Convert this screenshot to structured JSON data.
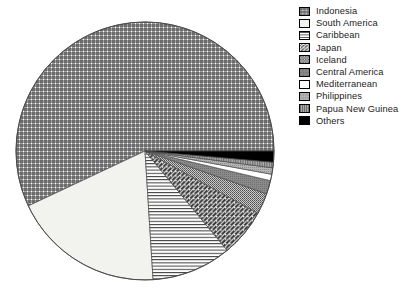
{
  "chart_data": {
    "type": "pie",
    "title": "",
    "subtitle": "",
    "xlabel": "",
    "ylabel": "",
    "legend_position": "right",
    "grid": false,
    "start_angle_deg": 0,
    "direction": "counterclockwise",
    "center": {
      "x": 145,
      "y": 151
    },
    "radius": 129,
    "categories": [
      "Indonesia",
      "South America",
      "Caribbean",
      "Japan",
      "Iceland",
      "Central America",
      "Mediterranean",
      "Philippines",
      "Papua New Guinea",
      "Others"
    ],
    "values": [
      57.0,
      19.0,
      10.0,
      6.0,
      2.6,
      1.7,
      0.8,
      0.8,
      0.7,
      1.4
    ],
    "slices": [
      {
        "label": "Indonesia",
        "value": 57.0,
        "pattern": "cross-hatch-grid",
        "fill": "#ffffff",
        "ink": "#2b2b2b",
        "start_deg": 0.0,
        "end_deg": 205.2
      },
      {
        "label": "South America",
        "value": 19.0,
        "pattern": "blank-light",
        "fill": "#f2f2ef",
        "ink": "#f2f2ef",
        "start_deg": 205.2,
        "end_deg": 273.6
      },
      {
        "label": "Caribbean",
        "value": 10.0,
        "pattern": "horizontal-lines",
        "fill": "#ffffff",
        "ink": "#3a3a3a",
        "start_deg": 273.6,
        "end_deg": 309.6
      },
      {
        "label": "Japan",
        "value": 6.0,
        "pattern": "diagonal-hatch",
        "fill": "#ffffff",
        "ink": "#3a3a3a",
        "start_deg": 309.6,
        "end_deg": 331.2
      },
      {
        "label": "Iceland",
        "value": 2.6,
        "pattern": "fine-stipple",
        "fill": "#bdbdbd",
        "ink": "#4d4d4d",
        "start_deg": 331.2,
        "end_deg": 340.6
      },
      {
        "label": "Central America",
        "value": 1.7,
        "pattern": "dark-gray-solid",
        "fill": "#8a8a8a",
        "ink": "#6b6b6b",
        "start_deg": 340.6,
        "end_deg": 346.7
      },
      {
        "label": "Mediterranean",
        "value": 0.8,
        "pattern": "white-blank",
        "fill": "#ffffff",
        "ink": "#ffffff",
        "start_deg": 346.7,
        "end_deg": 349.6
      },
      {
        "label": "Philippines",
        "value": 0.8,
        "pattern": "light-gray-stipple",
        "fill": "#a8a8a8",
        "ink": "#8f8f8f",
        "start_deg": 349.6,
        "end_deg": 352.5
      },
      {
        "label": "Papua New Guinea",
        "value": 0.7,
        "pattern": "gray-vertical-lines",
        "fill": "#9e9e9e",
        "ink": "#6f6f6f",
        "start_deg": 352.5,
        "end_deg": 355.0
      },
      {
        "label": "Others",
        "value": 1.4,
        "pattern": "solid-black",
        "fill": "#000000",
        "ink": "#000000",
        "start_deg": 355.0,
        "end_deg": 360.0
      }
    ]
  },
  "legend": {
    "items": [
      {
        "label": "Indonesia",
        "pattern": "cross-hatch-grid"
      },
      {
        "label": "South America",
        "pattern": "blank-light"
      },
      {
        "label": "Caribbean",
        "pattern": "horizontal-lines"
      },
      {
        "label": "Japan",
        "pattern": "diagonal-hatch"
      },
      {
        "label": "Iceland",
        "pattern": "fine-stipple"
      },
      {
        "label": "Central America",
        "pattern": "dark-gray-solid"
      },
      {
        "label": "Mediterranean",
        "pattern": "white-blank"
      },
      {
        "label": "Philippines",
        "pattern": "light-gray-stipple"
      },
      {
        "label": "Papua New Guinea",
        "pattern": "gray-vertical-lines"
      },
      {
        "label": "Others",
        "pattern": "solid-black"
      }
    ]
  },
  "colors": {
    "background": "#ffffff",
    "outline": "#4a4a4a",
    "text": "#1c1c1c",
    "black_slice": "#000000"
  }
}
